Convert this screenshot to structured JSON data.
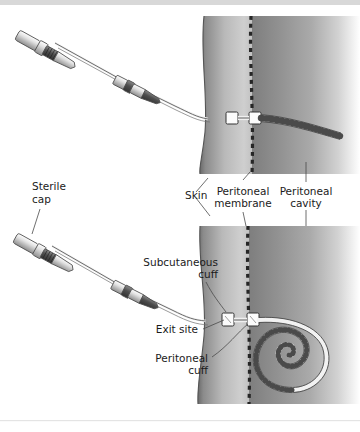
{
  "figure": {
    "background_color": "#ffffff",
    "top_border_color": "#d8d8d8",
    "bottom_border_color": "#e4e4e4",
    "width": 360,
    "height": 432
  },
  "labels": {
    "sterile_cap_line1": "Sterile",
    "sterile_cap_line2": "cap",
    "skin": "Skin",
    "peritoneal_membrane_line1": "Peritoneal",
    "peritoneal_membrane_line2": "membrane",
    "peritoneal_cavity_line1": "Peritoneal",
    "peritoneal_cavity_line2": "cavity",
    "subcutaneous_cuff_line1": "Subcutaneous",
    "subcutaneous_cuff_line2": "cuff",
    "exit_site": "Exit site",
    "peritoneal_cuff_line1": "Peritoneal",
    "peritoneal_cuff_line2": "cuff"
  },
  "panels": {
    "top_panel_name": "straight-tip-catheter-view",
    "bottom_panel_name": "coiled-tip-catheter-view"
  },
  "anatomy": {
    "skin_layer_label": "abdominal-wall",
    "membrane_style": "dashed",
    "membrane_color": "#2b2b2b",
    "wall_gradient_dark": "#6f6f6f",
    "wall_gradient_light": "#d5d5d5",
    "cavity_gradient_dark": "#8d8d8d",
    "cavity_gradient_light": "#ffffff"
  },
  "hardware": {
    "cap_color": "#e8e8e8",
    "collar_color": "#bdbdbd",
    "stripe_color": "#585858",
    "adapter_color": "#cfcfcf",
    "cuff_color": "#fbfbfb",
    "cuff_border": "#3a3a3a",
    "catheter_color": "#efefef",
    "catheter_border": "#555555",
    "perforation_color": "#2e2e2e"
  }
}
